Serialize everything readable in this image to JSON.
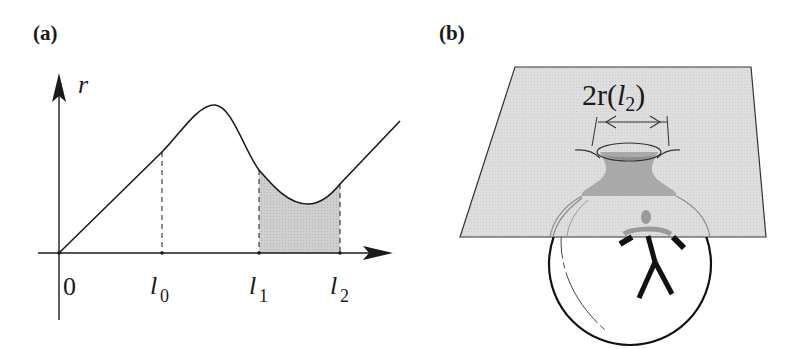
{
  "figure": {
    "panel_a": {
      "label": "(a)",
      "y_axis_label": "r",
      "origin_label": "0",
      "ticks": [
        {
          "symbol": "l",
          "subscript": "0"
        },
        {
          "symbol": "l",
          "subscript": "1"
        },
        {
          "symbol": "l",
          "subscript": "2"
        }
      ],
      "shaded_region": "between l1 and l2 under curve",
      "colors": {
        "line": "#1a1a1a",
        "shade": "#c8c8c8"
      }
    },
    "panel_b": {
      "label": "(b)",
      "annotation": {
        "prefix": "2r(",
        "symbol": "l",
        "subscript": "2",
        "suffix": ")"
      },
      "colors": {
        "plane": "#dcdcdc",
        "throat": "#a8a8a8",
        "figure": "#111111",
        "head": "#999999"
      }
    }
  }
}
